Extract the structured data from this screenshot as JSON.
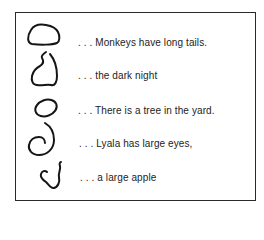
{
  "figure": {
    "rows": [
      {
        "shape": "rounded-blob-shape",
        "text": ". . . Monkeys have long tails."
      },
      {
        "shape": "hooked-open-shape",
        "text": ". . . the dark night"
      },
      {
        "shape": "tilted-oval-shape",
        "text": ". . . There is a tree in the yard."
      },
      {
        "shape": "spiral-shape",
        "text": ". . . Lyala has large eyes,"
      },
      {
        "shape": "squiggle-shape",
        "text": ". . . a large apple"
      }
    ]
  }
}
